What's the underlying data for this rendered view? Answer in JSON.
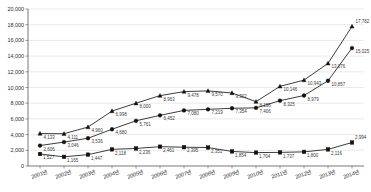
{
  "chart_data": {
    "type": "line",
    "title": "",
    "xlabel": "",
    "ylabel": "",
    "ylim": [
      0,
      20000
    ],
    "ytick_step": 2000,
    "grid": true,
    "legend": "none",
    "categories": [
      "2001년",
      "2002년",
      "2003년",
      "2004년",
      "2005년",
      "2006년",
      "2007년",
      "2008년",
      "2009년",
      "2010년",
      "2011년",
      "2012년",
      "2013년",
      "2014년"
    ],
    "ytick_labels": [
      "0",
      "2,000",
      "4,000",
      "6,000",
      "8,000",
      "10,000",
      "12,000",
      "14,000",
      "16,000",
      "18,000",
      "20,000"
    ],
    "ytick_values": [
      0,
      2000,
      4000,
      6000,
      8000,
      10000,
      12000,
      14000,
      16000,
      18000,
      20000
    ],
    "series": [
      {
        "name": "series-triangle",
        "marker": "triangle",
        "values": [
          4133,
          4111,
          4960,
          6998,
          8000,
          8963,
          9478,
          9570,
          9302,
          8198,
          10146,
          10943,
          13076,
          17782
        ],
        "labels": [
          "4,133",
          "4,111",
          "4,960",
          "6,998",
          "8,000",
          "8,963",
          "9,478",
          "9,570",
          "9,302",
          "8,198",
          "10,146",
          "10,943",
          "13,076",
          "17,782"
        ]
      },
      {
        "name": "series-circle",
        "marker": "circle",
        "values": [
          2606,
          3046,
          3536,
          4680,
          5761,
          6452,
          7080,
          7219,
          7354,
          7406,
          8325,
          8979,
          10857,
          15025
        ],
        "labels": [
          "2,606",
          "3,046",
          "3,536",
          "4,680",
          "5,761",
          "6,452",
          "7,080",
          "7,219",
          "7,354",
          "7,406",
          "8,325",
          "8,979",
          "10,857",
          "15,025"
        ]
      },
      {
        "name": "series-square",
        "marker": "square",
        "values": [
          1527,
          1165,
          1447,
          2118,
          2236,
          2461,
          2395,
          2351,
          1854,
          1704,
          1737,
          1800,
          2116,
          2994
        ],
        "labels": [
          "1,527",
          "1,165",
          "1,447",
          "2,118",
          "2,236",
          "2,461",
          "2,395",
          "2,351",
          "1,854",
          "1,704",
          "1,737",
          "1,800",
          "2,116",
          "2,994"
        ]
      }
    ],
    "colors": {
      "line": "#1a1a1a",
      "marker": "#111111",
      "grid": "#d4d4d4",
      "axis": "#555555",
      "label_text": "#3a3a3a",
      "tick_text": "#2b2b2b",
      "background": "#ffffff"
    }
  }
}
